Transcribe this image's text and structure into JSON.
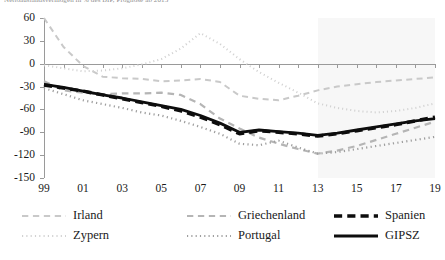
{
  "caption": "Nettoauslandsvermögen in % des BIP, Prognose ab 2013",
  "chart_data": {
    "type": "line",
    "title": "",
    "subtitle": "",
    "xlabel": "",
    "ylabel": "",
    "grid": false,
    "legend_position": "bottom",
    "xlim": [
      1999,
      2019
    ],
    "ylim": [
      -150,
      60
    ],
    "ytick_values": [
      60,
      30,
      0,
      -30,
      -60,
      -90,
      -120,
      -150
    ],
    "ytick_labels": [
      "60",
      "30",
      "0",
      "-30",
      "-60",
      "-90",
      "-120",
      "-150"
    ],
    "xtick_values": [
      1999,
      2001,
      2003,
      2005,
      2007,
      2009,
      2011,
      2013,
      2015,
      2017,
      2019
    ],
    "xtick_labels": [
      "99",
      "01",
      "03",
      "05",
      "07",
      "09",
      "11",
      "13",
      "15",
      "17",
      "19"
    ],
    "x": [
      1999,
      2000,
      2001,
      2002,
      2003,
      2004,
      2005,
      2006,
      2007,
      2008,
      2009,
      2010,
      2011,
      2012,
      2013,
      2014,
      2015,
      2016,
      2017,
      2018,
      2019
    ],
    "forecast_start": 2013,
    "forecast_shading_color": "#f7f7f7",
    "series": [
      {
        "name": "Irland",
        "style": "dashed",
        "color": "#c9c9c9",
        "width": 2.0,
        "values": [
          60,
          22,
          -3,
          -17,
          -19,
          -20,
          -23,
          -22,
          -20,
          -24,
          -42,
          -46,
          -48,
          -42,
          -35,
          -30,
          -27,
          -24,
          -22,
          -20,
          -18
        ]
      },
      {
        "name": "Zypern",
        "style": "dotted",
        "color": "#d2d2d2",
        "width": 2.0,
        "values": [
          -2,
          -6,
          -10,
          -9,
          -6,
          -1,
          6,
          20,
          40,
          26,
          6,
          -11,
          -25,
          -38,
          -52,
          -58,
          -62,
          -64,
          -62,
          -58,
          -52
        ]
      },
      {
        "name": "Griechenland",
        "style": "dashed",
        "color": "#b5b5b5",
        "width": 2.2,
        "values": [
          -23,
          -35,
          -38,
          -40,
          -39,
          -39,
          -38,
          -41,
          -53,
          -72,
          -85,
          -97,
          -105,
          -112,
          -118,
          -114,
          -108,
          -100,
          -92,
          -84,
          -76
        ]
      },
      {
        "name": "Portugal",
        "style": "dotted",
        "color": "#9e9e9e",
        "width": 2.2,
        "values": [
          -32,
          -40,
          -48,
          -53,
          -58,
          -64,
          -68,
          -75,
          -83,
          -92,
          -105,
          -107,
          -101,
          -110,
          -118,
          -116,
          -112,
          -108,
          -104,
          -100,
          -96
        ]
      },
      {
        "name": "Spanien",
        "style": "dashed-bold",
        "color": "#0d0d0d",
        "width": 3.4,
        "values": [
          -28,
          -32,
          -36,
          -41,
          -46,
          -51,
          -56,
          -62,
          -70,
          -80,
          -92,
          -88,
          -90,
          -92,
          -95,
          -92,
          -88,
          -84,
          -80,
          -75,
          -70
        ]
      },
      {
        "name": "GIPSZ",
        "style": "solid",
        "color": "#0d0d0d",
        "width": 2.8,
        "values": [
          -27,
          -31,
          -36,
          -41,
          -45,
          -50,
          -55,
          -60,
          -68,
          -78,
          -90,
          -87,
          -89,
          -91,
          -94,
          -91,
          -87,
          -83,
          -79,
          -75,
          -72
        ]
      }
    ]
  },
  "legend": {
    "items": [
      {
        "label": "Irland",
        "style": "dashed",
        "color": "#c9c9c9"
      },
      {
        "label": "Griechenland",
        "style": "dashed",
        "color": "#b5b5b5"
      },
      {
        "label": "Spanien",
        "style": "dashed-bold",
        "color": "#0d0d0d"
      },
      {
        "label": "Zypern",
        "style": "dotted",
        "color": "#d2d2d2"
      },
      {
        "label": "Portugal",
        "style": "dotted",
        "color": "#9e9e9e"
      },
      {
        "label": "GIPSZ",
        "style": "solid",
        "color": "#0d0d0d"
      }
    ]
  }
}
